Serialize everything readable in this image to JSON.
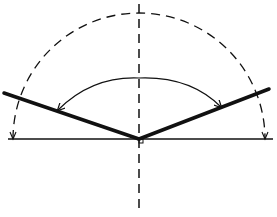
{
  "diagram": {
    "colors": {
      "ink": "#111111",
      "background": "#ffffff"
    },
    "baseline": {
      "x1": 8,
      "y1": 139,
      "x2": 273,
      "y2": 139
    },
    "vertical_axis": {
      "x": 139,
      "y1": 4,
      "y2": 212,
      "dashed": true
    },
    "vertex": {
      "x": 139,
      "y": 139
    },
    "left_line": {
      "x1": 4,
      "y1": 93,
      "x2": 139,
      "y2": 139
    },
    "right_line": {
      "x1": 139,
      "y1": 139,
      "x2": 269,
      "y2": 89
    },
    "dashed_semicircle": {
      "cx": 139,
      "cy": 139,
      "r": 126
    },
    "angle_arc": {
      "x1": 57,
      "y1": 110,
      "x2": 222,
      "y2": 107,
      "ctrl_y": 50
    },
    "right_angle_marker": {
      "x": 139,
      "y": 139,
      "size": 4
    }
  }
}
